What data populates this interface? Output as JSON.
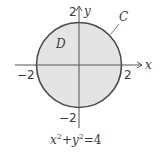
{
  "figure": {
    "region_label": "D",
    "curve_label": "C",
    "x_axis_label": "x",
    "y_axis_label": "y",
    "tick_labels": {
      "x_neg": "−2",
      "x_pos": "2",
      "y_pos": "2",
      "y_neg": "−2"
    },
    "equation": {
      "x": "x",
      "sup1": "2",
      "plus": "+",
      "y": "y",
      "sup2": "2",
      "eq": "=4"
    },
    "radius": 2,
    "colors": {
      "fill": "#e4e4e4",
      "stroke": "#4a4a4a",
      "axis": "#555555"
    }
  }
}
